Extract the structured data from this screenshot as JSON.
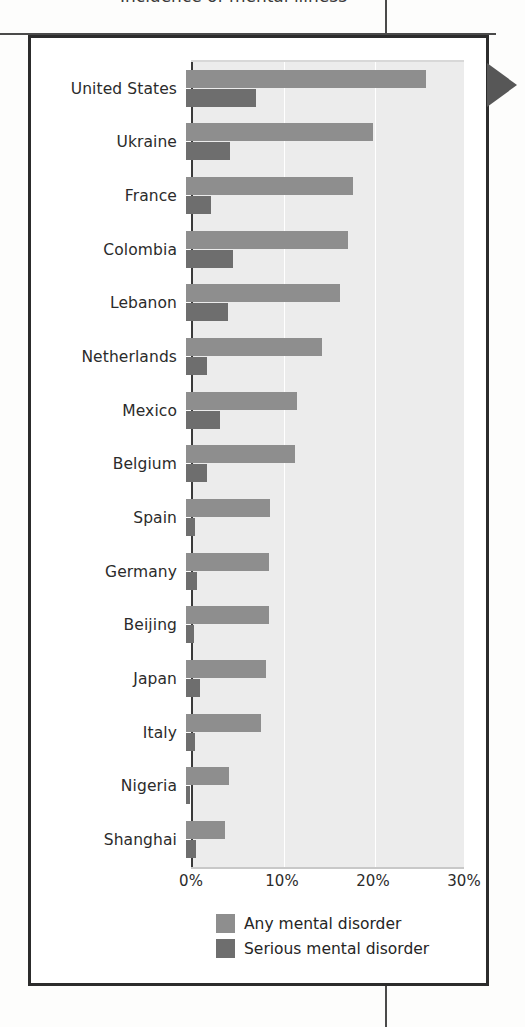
{
  "page": {
    "partial_title_above": "Incidence of mental illness"
  },
  "figure": {
    "edge_marker": "triangle-tab"
  },
  "chart_data": {
    "type": "bar",
    "orientation": "horizontal",
    "title": "",
    "xlabel": "",
    "ylabel": "",
    "xlim": [
      0,
      30
    ],
    "grid": true,
    "legend_position": "bottom",
    "tick_labels": [
      "0%",
      "10%",
      "20%",
      "30%"
    ],
    "tick_values": [
      0,
      10,
      20,
      30
    ],
    "categories": [
      "United States",
      "Ukraine",
      "France",
      "Colombia",
      "Lebanon",
      "Netherlands",
      "Mexico",
      "Belgium",
      "Spain",
      "Germany",
      "Beijing",
      "Japan",
      "Italy",
      "Nigeria",
      "Shanghai"
    ],
    "series": [
      {
        "name": "Any mental disorder",
        "color": "#8e8e8e",
        "values": [
          26.4,
          20.5,
          18.4,
          17.8,
          16.9,
          14.9,
          12.2,
          12.0,
          9.2,
          9.1,
          9.1,
          8.8,
          8.2,
          4.7,
          4.3
        ]
      },
      {
        "name": "Serious mental disorder",
        "color": "#6e6e6e",
        "values": [
          7.7,
          4.8,
          2.7,
          5.2,
          4.6,
          2.3,
          3.7,
          2.3,
          1.0,
          1.2,
          0.9,
          1.5,
          1.0,
          0.4,
          1.1
        ]
      }
    ]
  },
  "colors": {
    "plot_background": "#ececec",
    "gridline": "#ffffff",
    "frame": "#2c2c2c",
    "text": "#2b2b2b"
  }
}
